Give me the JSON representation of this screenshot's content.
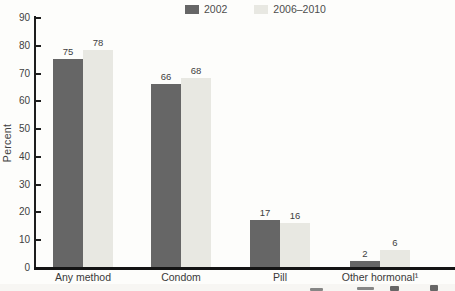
{
  "chart_data": {
    "type": "bar",
    "title": "",
    "xlabel": "",
    "ylabel": "Percent",
    "ylim": [
      0,
      90
    ],
    "yticks": [
      0,
      10,
      20,
      30,
      40,
      50,
      60,
      70,
      80,
      90
    ],
    "grid": false,
    "legend_position": "top-center",
    "categories": [
      "Any method",
      "Condom",
      "Pill",
      "Other hormonal¹"
    ],
    "series": [
      {
        "name": "2002",
        "color": "#666666",
        "values": [
          75,
          66,
          17,
          2
        ]
      },
      {
        "name": "2006–2010",
        "color": "#e8e8e2",
        "values": [
          78,
          68,
          16,
          6
        ]
      }
    ],
    "value_labels_shown": true
  }
}
